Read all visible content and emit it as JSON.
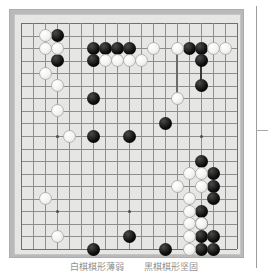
{
  "figure": {
    "kind": "go-board-diagram",
    "caption_left": "白棋棋形薄弱",
    "caption_right": "黑棋棋形坚固",
    "colors": {
      "board": "#e6e6e4",
      "frame": "#b9b9b9",
      "gridline": "#8e8e8c",
      "black_stone": "#0d0d0d",
      "white_stone": "#f3f3f1",
      "hoshi": "#4c4c4a",
      "caption_text": "#6a6a6a"
    }
  },
  "board": {
    "size": 19,
    "columns": [
      "A",
      "B",
      "C",
      "D",
      "E",
      "F",
      "G",
      "H",
      "J",
      "K",
      "L",
      "M",
      "N",
      "O",
      "P",
      "Q",
      "R",
      "S",
      "T"
    ],
    "hoshi": [
      {
        "col": 4,
        "row": 4
      },
      {
        "col": 10,
        "row": 4
      },
      {
        "col": 16,
        "row": 4
      },
      {
        "col": 4,
        "row": 10
      },
      {
        "col": 10,
        "row": 10
      },
      {
        "col": 16,
        "row": 10
      },
      {
        "col": 4,
        "row": 16
      },
      {
        "col": 10,
        "row": 16
      },
      {
        "col": 16,
        "row": 16
      }
    ],
    "black_stones": [
      {
        "col": 4,
        "row": 2
      },
      {
        "col": 4,
        "row": 4
      },
      {
        "col": 7,
        "row": 3
      },
      {
        "col": 8,
        "row": 3
      },
      {
        "col": 9,
        "row": 3
      },
      {
        "col": 10,
        "row": 3
      },
      {
        "col": 7,
        "row": 4
      },
      {
        "col": 7,
        "row": 7
      },
      {
        "col": 7,
        "row": 10
      },
      {
        "col": 10,
        "row": 10
      },
      {
        "col": 13,
        "row": 9
      },
      {
        "col": 15,
        "row": 3
      },
      {
        "col": 16,
        "row": 3
      },
      {
        "col": 16,
        "row": 4
      },
      {
        "col": 16,
        "row": 6
      },
      {
        "col": 16,
        "row": 12
      },
      {
        "col": 17,
        "row": 13
      },
      {
        "col": 17,
        "row": 14
      },
      {
        "col": 17,
        "row": 15
      },
      {
        "col": 16,
        "row": 16
      },
      {
        "col": 16,
        "row": 17
      },
      {
        "col": 16,
        "row": 18
      },
      {
        "col": 17,
        "row": 18
      },
      {
        "col": 16,
        "row": 19
      },
      {
        "col": 17,
        "row": 19
      },
      {
        "col": 10,
        "row": 18
      },
      {
        "col": 7,
        "row": 19
      },
      {
        "col": 13,
        "row": 19
      }
    ],
    "white_stones": [
      {
        "col": 3,
        "row": 2
      },
      {
        "col": 3,
        "row": 3
      },
      {
        "col": 4,
        "row": 3
      },
      {
        "col": 3,
        "row": 5
      },
      {
        "col": 4,
        "row": 6
      },
      {
        "col": 4,
        "row": 8
      },
      {
        "col": 5,
        "row": 10
      },
      {
        "col": 8,
        "row": 4
      },
      {
        "col": 9,
        "row": 4
      },
      {
        "col": 10,
        "row": 4
      },
      {
        "col": 11,
        "row": 4
      },
      {
        "col": 12,
        "row": 3
      },
      {
        "col": 14,
        "row": 3
      },
      {
        "col": 14,
        "row": 7
      },
      {
        "col": 17,
        "row": 3
      },
      {
        "col": 18,
        "row": 3
      },
      {
        "col": 3,
        "row": 15
      },
      {
        "col": 4,
        "row": 18
      },
      {
        "col": 15,
        "row": 13
      },
      {
        "col": 16,
        "row": 13
      },
      {
        "col": 14,
        "row": 14
      },
      {
        "col": 16,
        "row": 14
      },
      {
        "col": 15,
        "row": 15
      },
      {
        "col": 15,
        "row": 16
      },
      {
        "col": 15,
        "row": 17
      },
      {
        "col": 16,
        "row": 17
      },
      {
        "col": 15,
        "row": 18
      },
      {
        "col": 15,
        "row": 19
      }
    ],
    "chains": [
      {
        "name": "white-connection",
        "col": 14,
        "row_start": 3,
        "row_end": 7,
        "color": "#6b6b6b"
      },
      {
        "name": "black-connection",
        "col": 16,
        "row_start": 3,
        "row_end": 6,
        "color": "#3a3a3a"
      }
    ]
  }
}
